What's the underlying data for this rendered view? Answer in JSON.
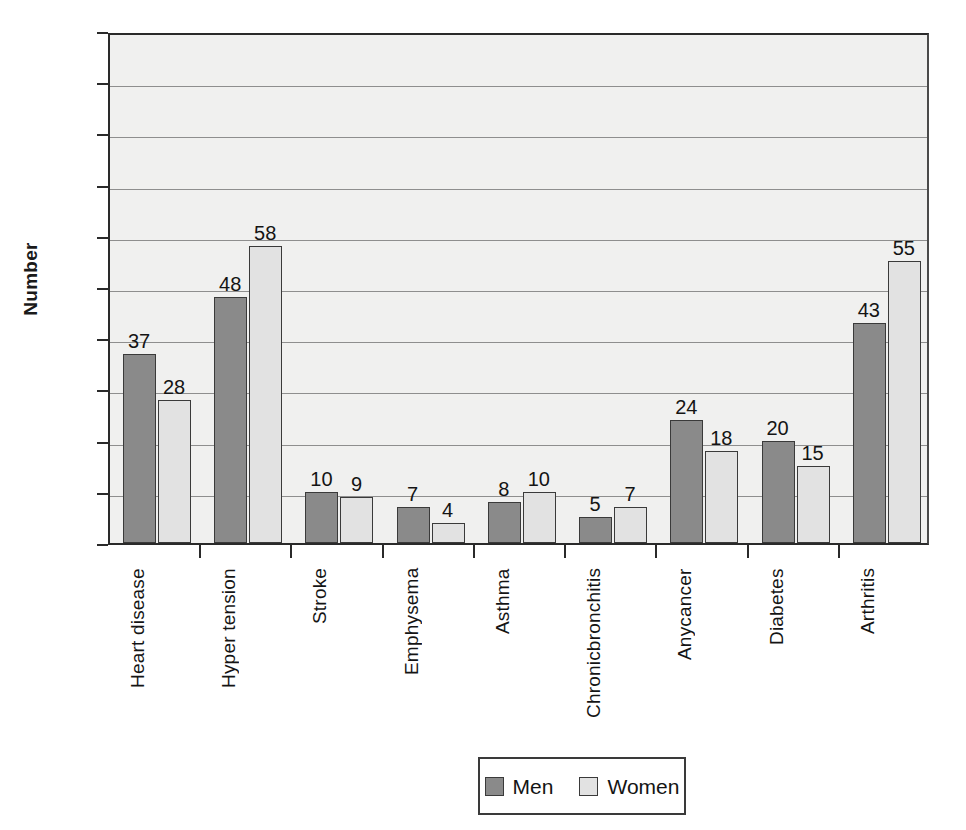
{
  "chart_data": {
    "type": "bar",
    "title": "",
    "xlabel": "",
    "ylabel": "Number",
    "ylim": [
      0,
      100
    ],
    "ytick_step": 10,
    "yticks": [
      100,
      90,
      80,
      70,
      60,
      50,
      40,
      30,
      20,
      10,
      0
    ],
    "grid": true,
    "legend_position": "bottom-center",
    "categories": [
      "Heart disease",
      "Hyper tension",
      "Stroke",
      "Emphysema",
      "Asthma",
      "Chronic bronchitis",
      "Any cancer",
      "Diabetes",
      "Arthritis"
    ],
    "category_lines": [
      [
        "Heart disease"
      ],
      [
        "Hyper tension"
      ],
      [
        "Stroke"
      ],
      [
        "Emphysema"
      ],
      [
        "Asthma"
      ],
      [
        "Chronic",
        "bronchitis"
      ],
      [
        "Any",
        "cancer"
      ],
      [
        "Diabetes"
      ],
      [
        "Arthritis"
      ]
    ],
    "series": [
      {
        "name": "Men",
        "color": "#8a8a8a",
        "values": [
          37,
          48,
          10,
          7,
          8,
          5,
          24,
          20,
          43
        ]
      },
      {
        "name": "Women",
        "color": "#e2e2e2",
        "values": [
          28,
          58,
          9,
          4,
          10,
          7,
          18,
          15,
          55
        ]
      }
    ]
  },
  "legend": {
    "items": [
      {
        "label": "Men",
        "color": "#8a8a8a"
      },
      {
        "label": "Women",
        "color": "#e2e2e2"
      }
    ]
  },
  "colors": {
    "men_bar": "#8a8a8a",
    "women_bar": "#e2e2e2",
    "plot_background": "#f0f0ef",
    "axis": "#2a2a2a",
    "gridline": "#8e8e8e",
    "page_background": "#ffffff"
  }
}
